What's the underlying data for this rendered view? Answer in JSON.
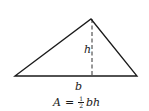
{
  "figure": {
    "type": "triangle-area-diagram",
    "stroke_color": "#1a1a1a",
    "background": "#ffffff",
    "vertices": {
      "apex": [
        91,
        19
      ],
      "base_left": [
        15,
        76
      ],
      "base_right": [
        137,
        76
      ]
    },
    "altitude": {
      "x": 92,
      "y_top": 19,
      "y_bottom": 76,
      "style": "dashed"
    }
  },
  "labels": {
    "height": "h",
    "base": "b"
  },
  "formula": {
    "lhs": "A",
    "equals": "=",
    "fraction_numerator": "1",
    "fraction_denominator": "2",
    "rhs_vars": "bh"
  }
}
